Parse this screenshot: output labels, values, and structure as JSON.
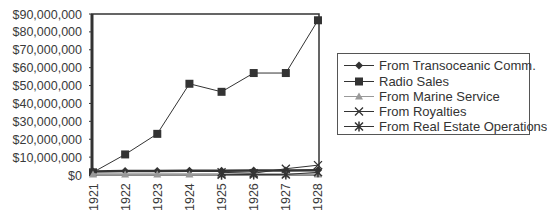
{
  "chart_data": {
    "type": "line",
    "title": "",
    "xlabel": "",
    "ylabel": "",
    "categories": [
      "1921",
      "1922",
      "1923",
      "1924",
      "1925",
      "1926",
      "1927",
      "1928"
    ],
    "ylim": [
      0,
      90000000
    ],
    "yticks": [
      "$0",
      "$10,000,000",
      "$20,000,000",
      "$30,000,000",
      "$40,000,000",
      "$50,000,000",
      "$60,000,000",
      "$70,000,000",
      "$80,000,000",
      "$90,000,000"
    ],
    "grid": false,
    "legend_position": "right",
    "series": [
      {
        "name": "From Transoceanic Comm.",
        "marker": "diamond",
        "color": "#333333",
        "values": [
          2000000,
          2200000,
          2300000,
          2400000,
          2400000,
          2500000,
          2500000,
          2700000
        ]
      },
      {
        "name": "Radio Sales",
        "marker": "square",
        "color": "#333333",
        "values": [
          1500000,
          11500000,
          23000000,
          51000000,
          46500000,
          57000000,
          57000000,
          86500000
        ]
      },
      {
        "name": "From Marine Service",
        "marker": "triangle",
        "color": "#999999",
        "values": [
          300000,
          300000,
          300000,
          300000,
          300000,
          300000,
          300000,
          300000
        ]
      },
      {
        "name": "From Royalties",
        "marker": "x",
        "color": "#333333",
        "values": [
          null,
          null,
          null,
          null,
          1500000,
          1000000,
          3500000,
          5500000
        ]
      },
      {
        "name": "From Real Estate Operations",
        "marker": "star",
        "color": "#333333",
        "values": [
          null,
          null,
          null,
          null,
          200000,
          300000,
          300000,
          1500000
        ]
      }
    ]
  }
}
